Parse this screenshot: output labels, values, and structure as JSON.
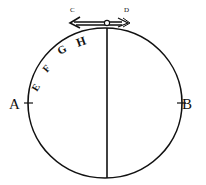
{
  "diagram": {
    "labels": {
      "A": "A",
      "B": "B",
      "C": "C",
      "D": "D",
      "E": "E",
      "F": "F",
      "G": "G",
      "H": "H"
    },
    "colors": {
      "ink": "#111111",
      "background": "#ffffff"
    }
  }
}
